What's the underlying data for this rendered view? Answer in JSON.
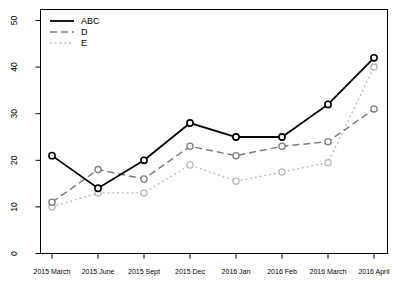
{
  "chart_data": {
    "type": "line",
    "title": "",
    "xlabel": "",
    "ylabel": "",
    "categories": [
      "2015 March",
      "2015 June",
      "2015 Sept",
      "2015 Dec",
      "2016 Jan",
      "2016 Feb",
      "2016 March",
      "2016 April"
    ],
    "series": [
      {
        "name": "E",
        "values": [
          10,
          13,
          13,
          19,
          15.5,
          17.5,
          19.5,
          40
        ],
        "color": "#b8b8b8",
        "dash": "dotted",
        "width": 1.4
      },
      {
        "name": "D",
        "values": [
          11,
          18,
          16,
          23,
          21,
          23,
          24,
          31
        ],
        "color": "#7e7e7e",
        "dash": "dashed",
        "width": 1.5
      },
      {
        "name": "ABC",
        "values": [
          21,
          14,
          20,
          28,
          25,
          25,
          32,
          42
        ],
        "color": "#000000",
        "dash": "solid",
        "width": 1.8
      }
    ],
    "legend_order": [
      "ABC",
      "D",
      "E"
    ],
    "legend_position": "top-left",
    "marker": "open-circle",
    "ylim": [
      0,
      50
    ],
    "yticks": [
      0,
      10,
      20,
      30,
      40,
      50
    ],
    "grid": false,
    "axis_color": "#000000",
    "background": "#ffffff"
  }
}
